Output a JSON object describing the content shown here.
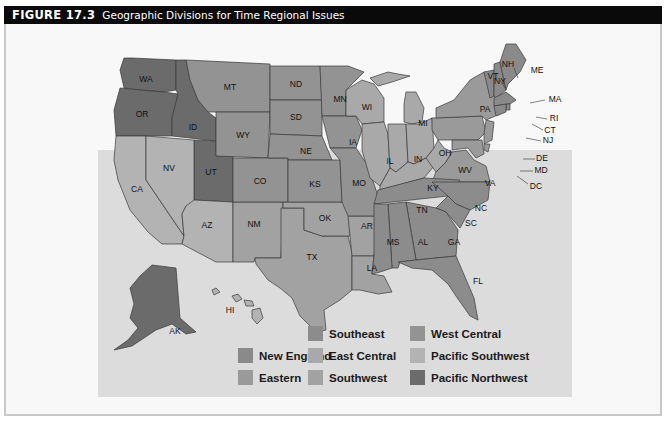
{
  "figure": {
    "number": "FIGURE 17.3",
    "title": "Geographic Divisions for Time Regional Issues"
  },
  "colors": {
    "new_england": "#8a8a8a",
    "eastern": "#9a9a9a",
    "southeast": "#8c8c8c",
    "east_central": "#a9a9a9",
    "southwest": "#a2a2a2",
    "west_central": "#939393",
    "pacific_southwest": "#b3b3b3",
    "pacific_northwest": "#6b6b6b"
  },
  "legend": [
    {
      "label": "Southeast",
      "color": "#8c8c8c"
    },
    {
      "label": "West Central",
      "color": "#939393"
    },
    {
      "label": "New England",
      "color": "#8a8a8a"
    },
    {
      "label": "East Central",
      "color": "#a9a9a9"
    },
    {
      "label": "Pacific Southwest",
      "color": "#b3b3b3"
    },
    {
      "label": "Eastern",
      "color": "#9a9a9a"
    },
    {
      "label": "Southwest",
      "color": "#a2a2a2"
    },
    {
      "label": "Pacific Northwest",
      "color": "#6b6b6b"
    }
  ],
  "states": {
    "WA": "WA",
    "OR": "OR",
    "ID": "ID",
    "MT": "MT",
    "WY": "WY",
    "ND": "ND",
    "SD": "SD",
    "NE": "NE",
    "MN": "MN",
    "IA": "IA",
    "WI": "WI",
    "MI": "MI",
    "IL": "IL",
    "IN": "IN",
    "OH": "OH",
    "KY": "KY",
    "WV": "WV",
    "VA": "VA",
    "PA": "PA",
    "NY": "NY",
    "VT": "VT",
    "NH": "NH",
    "ME": "ME",
    "MA": "MA",
    "RI": "RI",
    "CT": "CT",
    "NJ": "NJ",
    "DE": "DE",
    "MD": "MD",
    "DC": "DC",
    "NC": "NC",
    "SC": "SC",
    "TN": "TN",
    "GA": "GA",
    "AL": "AL",
    "MS": "MS",
    "FL": "FL",
    "LA": "LA",
    "AR": "AR",
    "MO": "MO",
    "KS": "KS",
    "OK": "OK",
    "TX": "TX",
    "NM": "NM",
    "CO": "CO",
    "UT": "UT",
    "AZ": "AZ",
    "NV": "NV",
    "CA": "CA",
    "AK": "AK",
    "HI": "HI"
  }
}
